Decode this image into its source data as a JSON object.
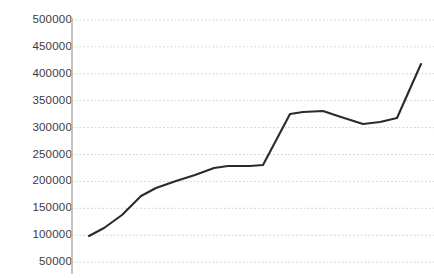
{
  "chart_data": {
    "type": "line",
    "title": "",
    "xlabel": "",
    "ylabel": "",
    "ylim": [
      50000,
      500000
    ],
    "yticks": [
      500000,
      450000,
      400000,
      350000,
      300000,
      250000,
      200000,
      150000,
      100000,
      50000
    ],
    "ytick_labels": [
      "500000",
      "450000",
      "400000",
      "350000",
      "300000",
      "250000",
      "200000",
      "150000",
      "100000",
      "50000"
    ],
    "grid": true,
    "grid_style": "dotted-horizontal",
    "legend": null,
    "xticks": [],
    "xtick_labels": [],
    "series": [
      {
        "name": "series-1",
        "color": "#2b2b2b",
        "x": [
          0,
          1,
          2,
          3,
          4,
          5,
          6,
          7,
          8,
          9,
          10,
          11,
          12,
          13,
          14,
          15,
          16,
          17,
          18,
          19,
          20,
          21,
          22
        ],
        "values": [
          90000,
          110000,
          132000,
          168000,
          184000,
          196000,
          208000,
          222000,
          225000,
          224000,
          248000,
          320000,
          325000,
          327000,
          318000,
          304000,
          308000,
          324000,
          415000,
          415000,
          415000,
          415000,
          415000
        ],
        "points": [
          {
            "x": 89,
            "y": 236,
            "value": 90000
          },
          {
            "x": 104,
            "y": 228,
            "value": 110000
          },
          {
            "x": 122,
            "y": 215,
            "value": 132000
          },
          {
            "x": 141,
            "y": 196,
            "value": 168000
          },
          {
            "x": 156,
            "y": 188,
            "value": 184000
          },
          {
            "x": 176,
            "y": 181,
            "value": 196000
          },
          {
            "x": 195,
            "y": 175,
            "value": 208000
          },
          {
            "x": 214,
            "y": 168,
            "value": 222000
          },
          {
            "x": 228,
            "y": 166,
            "value": 225000
          },
          {
            "x": 250,
            "y": 166,
            "value": 224000
          },
          {
            "x": 263,
            "y": 165,
            "value": 248000
          },
          {
            "x": 290,
            "y": 114,
            "value": 320000
          },
          {
            "x": 303,
            "y": 112,
            "value": 325000
          },
          {
            "x": 323,
            "y": 111,
            "value": 327000
          },
          {
            "x": 341,
            "y": 117,
            "value": 318000
          },
          {
            "x": 363,
            "y": 124,
            "value": 304000
          },
          {
            "x": 380,
            "y": 122,
            "value": 308000
          },
          {
            "x": 397,
            "y": 118,
            "value": 324000
          },
          {
            "x": 421,
            "y": 64,
            "value": 415000
          }
        ]
      }
    ],
    "colors": {
      "line": "#2b2b2b",
      "grid": "#cfcfcf",
      "axis": "#b5b5b5",
      "tick_text": "#3a3a3a",
      "background": "#ffffff"
    },
    "geometry": {
      "axis_x": 72,
      "plot_top": 20,
      "plot_bottom": 262,
      "pixels_per_tick": 26.9,
      "tick_y_positions": [
        20,
        46.9,
        73.8,
        100.7,
        127.6,
        154.5,
        181.4,
        208.3,
        235.2,
        262.1
      ]
    }
  }
}
